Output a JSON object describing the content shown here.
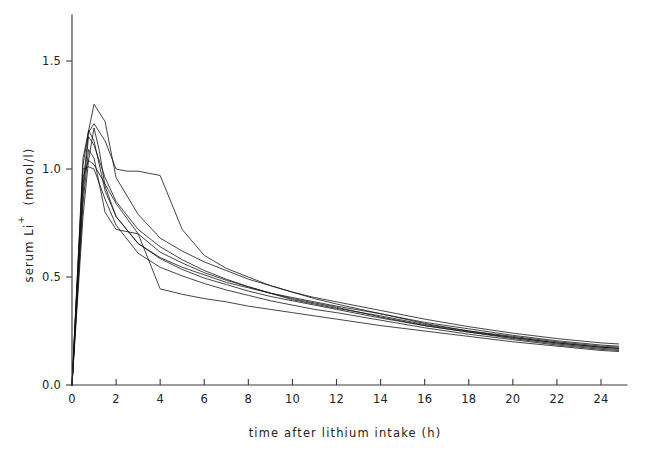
{
  "chart_data": {
    "type": "line",
    "title": "",
    "xlabel": "time after lithium intake (h)",
    "ylabel": "serum Li+ (mmol/l)",
    "ylabel_parts": {
      "main": "serum Li",
      "superscript": "+",
      "units": "(mmol/l)"
    },
    "xlim": [
      0,
      25.1
    ],
    "ylim": [
      0.0,
      1.62
    ],
    "xticks": [
      0,
      2,
      4,
      6,
      8,
      10,
      12,
      14,
      16,
      18,
      20,
      22,
      24
    ],
    "xticklabels": [
      "0",
      "2",
      "4",
      "6",
      "8",
      "10",
      "12",
      "14",
      "16",
      "18",
      "20",
      "22",
      "24"
    ],
    "yticks": [
      0.0,
      0.5,
      1.0,
      1.5
    ],
    "yticklabels": [
      "0.0",
      "0.5",
      "1.0",
      "1.5"
    ],
    "grid": false,
    "legend": false,
    "legend_position": "none",
    "n_series": 8,
    "series": [
      {
        "name": "subject-1",
        "x": [
          0,
          0.5,
          1.0,
          1.5,
          2.0,
          3.0,
          4.0,
          5.0,
          6.0,
          7.0,
          8.0,
          9.0,
          10.0,
          11.0,
          12.0,
          14.0,
          16.0,
          18.0,
          20.0,
          22.0,
          24.0,
          24.8
        ],
        "values": [
          0.0,
          1.05,
          1.3,
          1.22,
          0.96,
          0.79,
          0.68,
          0.62,
          0.57,
          0.53,
          0.49,
          0.46,
          0.43,
          0.4,
          0.375,
          0.33,
          0.285,
          0.25,
          0.22,
          0.195,
          0.175,
          0.17
        ]
      },
      {
        "name": "subject-2",
        "x": [
          0,
          0.5,
          0.75,
          1.0,
          1.5,
          2.0,
          2.5,
          3.0,
          4.0,
          5.0,
          6.0,
          7.0,
          8.0,
          9.0,
          10.0,
          11.0,
          12.0,
          14.0,
          16.0,
          18.0,
          20.0,
          22.0,
          24.0,
          24.8
        ],
        "values": [
          0.0,
          1.02,
          1.17,
          1.21,
          1.13,
          1.0,
          0.99,
          0.99,
          0.97,
          0.72,
          0.6,
          0.54,
          0.5,
          0.46,
          0.43,
          0.405,
          0.385,
          0.345,
          0.305,
          0.27,
          0.24,
          0.215,
          0.195,
          0.19
        ]
      },
      {
        "name": "subject-3",
        "x": [
          0,
          0.5,
          0.75,
          1.0,
          1.5,
          2.0,
          3.0,
          4.0,
          5.0,
          6.0,
          7.0,
          8.0,
          9.0,
          10.0,
          11.0,
          12.0,
          14.0,
          16.0,
          18.0,
          20.0,
          22.0,
          24.0,
          24.8
        ],
        "values": [
          0.0,
          0.88,
          1.15,
          1.11,
          0.96,
          0.85,
          0.72,
          0.64,
          0.58,
          0.53,
          0.49,
          0.455,
          0.425,
          0.4,
          0.38,
          0.36,
          0.315,
          0.275,
          0.245,
          0.215,
          0.19,
          0.17,
          0.165
        ]
      },
      {
        "name": "subject-4",
        "x": [
          0,
          0.5,
          0.75,
          1.0,
          1.5,
          2.0,
          3.0,
          4.0,
          5.0,
          6.0,
          7.0,
          8.0,
          9.0,
          10.0,
          11.0,
          12.0,
          14.0,
          16.0,
          18.0,
          20.0,
          22.0,
          24.0,
          24.8
        ],
        "values": [
          0.0,
          0.96,
          1.04,
          1.02,
          0.93,
          0.84,
          0.7,
          0.615,
          0.565,
          0.52,
          0.485,
          0.455,
          0.425,
          0.395,
          0.375,
          0.355,
          0.32,
          0.28,
          0.25,
          0.225,
          0.2,
          0.18,
          0.175
        ]
      },
      {
        "name": "subject-5",
        "x": [
          0,
          0.5,
          0.75,
          1.0,
          1.5,
          2.0,
          3.0,
          4.0,
          5.0,
          6.0,
          7.0,
          8.0,
          9.0,
          10.0,
          11.0,
          12.0,
          14.0,
          16.0,
          18.0,
          20.0,
          22.0,
          24.0,
          24.8
        ],
        "values": [
          0.0,
          1.0,
          1.01,
          1.0,
          0.86,
          0.74,
          0.61,
          0.545,
          0.505,
          0.47,
          0.44,
          0.415,
          0.39,
          0.37,
          0.35,
          0.335,
          0.3,
          0.265,
          0.235,
          0.21,
          0.185,
          0.165,
          0.16
        ]
      },
      {
        "name": "subject-6",
        "x": [
          0,
          0.5,
          0.75,
          1.0,
          1.5,
          2.0,
          2.5,
          3.0,
          4.0,
          5.0,
          6.0,
          7.0,
          8.0,
          9.0,
          10.0,
          11.0,
          12.0,
          14.0,
          16.0,
          18.0,
          20.0,
          22.0,
          24.0,
          24.8
        ],
        "values": [
          0.0,
          0.84,
          1.09,
          1.05,
          0.8,
          0.72,
          0.71,
          0.7,
          0.445,
          0.42,
          0.4,
          0.385,
          0.365,
          0.35,
          0.335,
          0.32,
          0.305,
          0.275,
          0.25,
          0.225,
          0.2,
          0.18,
          0.16,
          0.155
        ]
      },
      {
        "name": "subject-7",
        "x": [
          0,
          0.5,
          0.75,
          1.0,
          1.25,
          1.5,
          2.0,
          3.0,
          4.0,
          5.0,
          6.0,
          7.0,
          8.0,
          9.0,
          10.0,
          11.0,
          12.0,
          14.0,
          16.0,
          18.0,
          20.0,
          22.0,
          24.0,
          24.8
        ],
        "values": [
          0.0,
          0.78,
          1.04,
          1.19,
          1.08,
          0.92,
          0.78,
          0.655,
          0.585,
          0.535,
          0.495,
          0.465,
          0.435,
          0.41,
          0.39,
          0.37,
          0.35,
          0.31,
          0.275,
          0.245,
          0.22,
          0.195,
          0.175,
          0.17
        ]
      },
      {
        "name": "subject-8",
        "x": [
          0,
          0.5,
          0.75,
          1.0,
          1.5,
          2.0,
          3.0,
          4.0,
          5.0,
          6.0,
          7.0,
          8.0,
          9.0,
          10.0,
          11.0,
          12.0,
          14.0,
          16.0,
          18.0,
          20.0,
          22.0,
          24.0,
          24.8
        ],
        "values": [
          0.0,
          0.92,
          1.18,
          1.13,
          0.9,
          0.78,
          0.655,
          0.59,
          0.545,
          0.51,
          0.475,
          0.45,
          0.425,
          0.405,
          0.385,
          0.365,
          0.33,
          0.29,
          0.26,
          0.23,
          0.205,
          0.185,
          0.18
        ]
      }
    ]
  },
  "style": {
    "line_color": "#111111",
    "axis_color": "#3a3a3a",
    "text_color": "#222222",
    "background": "#ffffff"
  }
}
